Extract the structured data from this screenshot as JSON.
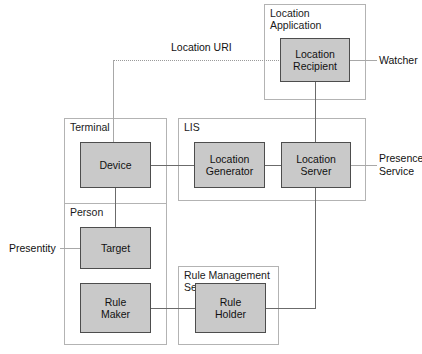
{
  "diagram": {
    "colors": {
      "node_fill": "#c9c9c9",
      "node_border": "#4d4d4d",
      "container_border": "#b3b3b3",
      "connector": "#6b6b6b",
      "background": "#ffffff"
    },
    "containers": [
      {
        "id": "location-application",
        "label": "Location\nApplication"
      },
      {
        "id": "terminal",
        "label": "Terminal"
      },
      {
        "id": "lis",
        "label": "LIS"
      },
      {
        "id": "person",
        "label": "Person"
      },
      {
        "id": "rule-management-service",
        "label": "Rule Management\nService"
      }
    ],
    "nodes": [
      {
        "id": "location-recipient",
        "label": "Location\nRecipient"
      },
      {
        "id": "device",
        "label": "Device"
      },
      {
        "id": "location-generator",
        "label": "Location\nGenerator"
      },
      {
        "id": "location-server",
        "label": "Location\nServer"
      },
      {
        "id": "target",
        "label": "Target"
      },
      {
        "id": "rule-maker",
        "label": "Rule\nMaker"
      },
      {
        "id": "rule-holder",
        "label": "Rule\nHolder"
      }
    ],
    "edge_labels": [
      {
        "id": "location-uri",
        "label": "Location URI"
      },
      {
        "id": "watcher",
        "label": "Watcher"
      },
      {
        "id": "presence-service",
        "label": "Presence\nService"
      },
      {
        "id": "presentity",
        "label": "Presentity"
      }
    ]
  }
}
